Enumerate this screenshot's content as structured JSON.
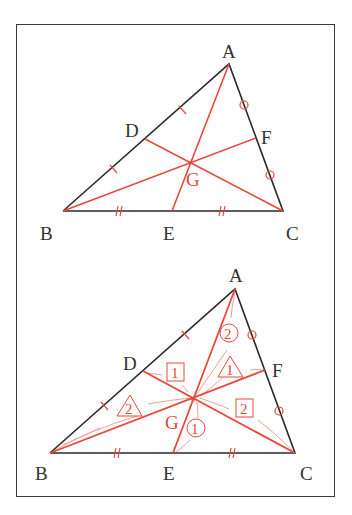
{
  "colors": {
    "edge": "#2a2a2a",
    "median": "#e8473a",
    "light": "#f0a090",
    "label": "#333333"
  },
  "top_panel": {
    "labels": {
      "A": "A",
      "B": "B",
      "C": "C",
      "D": "D",
      "E": "E",
      "F": "F",
      "G": "G"
    }
  },
  "bottom_panel": {
    "labels": {
      "A": "A",
      "B": "B",
      "C": "C",
      "D": "D",
      "E": "E",
      "F": "F",
      "G": "G"
    },
    "annotations": {
      "square_1": "1",
      "square_2": "2",
      "triangle_1": "1",
      "triangle_2": "2",
      "circle_1": "1",
      "circle_2": "2"
    }
  }
}
